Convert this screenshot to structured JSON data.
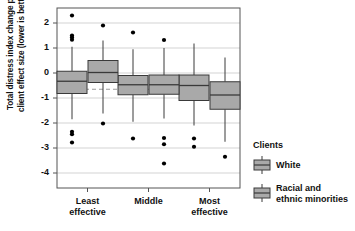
{
  "chart_data": {
    "type": "box",
    "title": "",
    "xlabel": "",
    "ylabel_line1": "Total distress index change per",
    "ylabel_line2": "client effect size (lower is better)",
    "categories": [
      "Least effective",
      "Middle",
      "Most effective"
    ],
    "category_labels": [
      {
        "line1": "Least",
        "line2": "effective"
      },
      {
        "line1": "Middle",
        "line2": ""
      },
      {
        "line1": "Most",
        "line2": "effective"
      }
    ],
    "ylim": [
      -4.6,
      2.6
    ],
    "yticks": [
      2,
      1,
      0,
      -1,
      -2,
      -3,
      -4
    ],
    "ytick_labels": [
      "2",
      "1",
      "0",
      "-1",
      "-2",
      "-3",
      "-4"
    ],
    "grid": true,
    "grid_axis": "y",
    "legend_position": "right",
    "reference_line": {
      "value": -0.65,
      "style": "dashed",
      "color": "#9a9a9a"
    },
    "box_fill": "#a9a9a9",
    "box_stroke": "#3a3a3a",
    "outlier_color": "#000000",
    "series": [
      {
        "name": "White",
        "boxes": [
          {
            "category": "Least effective",
            "lower_whisker": -1.85,
            "q1": -0.82,
            "median": -0.33,
            "q3": 0.07,
            "upper_whisker": 1.05,
            "outliers": [
              2.3,
              1.5,
              1.42,
              1.33,
              -2.35,
              -2.45,
              -2.78
            ]
          },
          {
            "category": "Middle",
            "lower_whisker": -1.95,
            "q1": -0.87,
            "median": -0.47,
            "q3": -0.1,
            "upper_whisker": 0.95,
            "outliers": [
              1.62,
              -2.62
            ]
          },
          {
            "category": "Most effective",
            "lower_whisker": -2.1,
            "q1": -1.1,
            "median": -0.5,
            "q3": -0.08,
            "upper_whisker": 1.18,
            "outliers": [
              -2.62,
              -2.95
            ]
          }
        ]
      },
      {
        "name": "Racial and ethnic minorities",
        "boxes": [
          {
            "category": "Least effective",
            "lower_whisker": -1.62,
            "q1": -0.38,
            "median": 0.02,
            "q3": 0.5,
            "upper_whisker": 1.3,
            "outliers": [
              1.9,
              -2.02
            ]
          },
          {
            "category": "Middle",
            "lower_whisker": -1.82,
            "q1": -0.85,
            "median": -0.47,
            "q3": -0.08,
            "upper_whisker": 1.0,
            "outliers": [
              1.32,
              -2.6,
              -2.85,
              -3.62
            ]
          },
          {
            "category": "Most effective",
            "lower_whisker": -2.75,
            "q1": -1.45,
            "median": -0.88,
            "q3": -0.35,
            "upper_whisker": 0.62,
            "outliers": [
              -3.35
            ]
          }
        ]
      }
    ]
  },
  "legend": {
    "title": "Clients",
    "items": [
      {
        "label_line1": "White",
        "label_line2": ""
      },
      {
        "label_line1": "Racial and",
        "label_line2": "ethnic minorities"
      }
    ]
  }
}
